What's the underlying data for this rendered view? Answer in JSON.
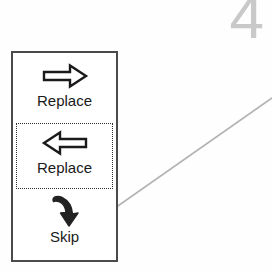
{
  "figure": {
    "number": "4",
    "number_color": "#c9c9c9",
    "leader_line_color": "#b3b3b3"
  },
  "toolbar": {
    "border_color": "#4a4a4a",
    "background": "#ffffff",
    "selection_border_color": "#2b2b2b",
    "items": [
      {
        "label": "Replace",
        "icon": "arrow-right-outline-icon",
        "icon_style": "outline",
        "direction": "right",
        "selected": false
      },
      {
        "label": "Replace",
        "icon": "arrow-left-outline-icon",
        "icon_style": "outline",
        "direction": "left",
        "selected": true
      },
      {
        "label": "Skip",
        "icon": "arrow-curved-down-solid-icon",
        "icon_style": "solid",
        "direction": "down",
        "selected": false
      }
    ]
  }
}
